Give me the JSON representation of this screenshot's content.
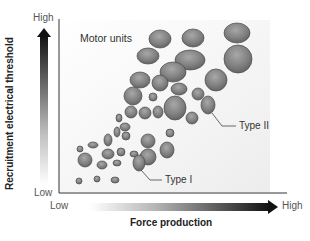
{
  "figure": {
    "title": "Motor units",
    "y_axis": {
      "title": "Recruitment electrical threshold",
      "high_label": "High",
      "low_label": "Low"
    },
    "x_axis": {
      "title": "Force production",
      "high_label": "High",
      "low_label": "Low"
    },
    "annotations": [
      {
        "label": "Type II",
        "target": "large fast-twitch motor unit"
      },
      {
        "label": "Type I",
        "target": "small slow-twitch motor unit"
      }
    ],
    "colors": {
      "unit_fill_dark": "#6b6b6b",
      "unit_fill_light": "#b0b0b0",
      "unit_stroke": "#4a4a4a",
      "axis": "#333333",
      "arrow_dark": "#1a1a1a",
      "panel_shade": "#f4f4f4"
    }
  },
  "units": [
    {
      "cx": 237,
      "cy": 33,
      "rx": 13,
      "ry": 10
    },
    {
      "cx": 238,
      "cy": 59,
      "rx": 14,
      "ry": 14
    },
    {
      "cx": 193,
      "cy": 38,
      "rx": 11,
      "ry": 9
    },
    {
      "cx": 160,
      "cy": 39,
      "rx": 11,
      "ry": 9
    },
    {
      "cx": 190,
      "cy": 60,
      "rx": 15,
      "ry": 10
    },
    {
      "cx": 216,
      "cy": 80,
      "rx": 11,
      "ry": 11
    },
    {
      "cx": 148,
      "cy": 56,
      "rx": 11,
      "ry": 8
    },
    {
      "cx": 173,
      "cy": 72,
      "rx": 13,
      "ry": 10
    },
    {
      "cx": 140,
      "cy": 80,
      "rx": 10,
      "ry": 8
    },
    {
      "cx": 160,
      "cy": 83,
      "rx": 8,
      "ry": 8
    },
    {
      "cx": 133,
      "cy": 96,
      "rx": 9,
      "ry": 9
    },
    {
      "cx": 179,
      "cy": 89,
      "rx": 8,
      "ry": 6
    },
    {
      "cx": 208,
      "cy": 105,
      "rx": 7,
      "ry": 9
    },
    {
      "cx": 198,
      "cy": 94,
      "rx": 6,
      "ry": 6
    },
    {
      "cx": 153,
      "cy": 97,
      "rx": 4,
      "ry": 4
    },
    {
      "cx": 175,
      "cy": 108,
      "rx": 11,
      "ry": 12
    },
    {
      "cx": 192,
      "cy": 118,
      "rx": 6,
      "ry": 6
    },
    {
      "cx": 131,
      "cy": 112,
      "rx": 6,
      "ry": 6
    },
    {
      "cx": 145,
      "cy": 113,
      "rx": 6,
      "ry": 6
    },
    {
      "cx": 158,
      "cy": 112,
      "rx": 5,
      "ry": 6
    },
    {
      "cx": 170,
      "cy": 133,
      "rx": 4,
      "ry": 4
    },
    {
      "cx": 119,
      "cy": 118,
      "rx": 3,
      "ry": 4
    },
    {
      "cx": 125,
      "cy": 127,
      "rx": 5,
      "ry": 4
    },
    {
      "cx": 117,
      "cy": 132,
      "rx": 3,
      "ry": 5
    },
    {
      "cx": 108,
      "cy": 140,
      "rx": 4,
      "ry": 6
    },
    {
      "cx": 126,
      "cy": 136,
      "rx": 4,
      "ry": 4
    },
    {
      "cx": 93,
      "cy": 145,
      "rx": 5,
      "ry": 3
    },
    {
      "cx": 108,
      "cy": 154,
      "rx": 6,
      "ry": 5
    },
    {
      "cx": 121,
      "cy": 152,
      "rx": 4,
      "ry": 4
    },
    {
      "cx": 134,
      "cy": 154,
      "rx": 4,
      "ry": 3
    },
    {
      "cx": 148,
      "cy": 141,
      "rx": 7,
      "ry": 7
    },
    {
      "cx": 148,
      "cy": 157,
      "rx": 8,
      "ry": 8
    },
    {
      "cx": 167,
      "cy": 150,
      "rx": 7,
      "ry": 8
    },
    {
      "cx": 80,
      "cy": 149,
      "rx": 3,
      "ry": 3
    },
    {
      "cx": 85,
      "cy": 160,
      "rx": 7,
      "ry": 7
    },
    {
      "cx": 102,
      "cy": 165,
      "rx": 5,
      "ry": 4
    },
    {
      "cx": 117,
      "cy": 163,
      "rx": 4,
      "ry": 3
    },
    {
      "cx": 139,
      "cy": 163,
      "rx": 6,
      "ry": 8
    },
    {
      "cx": 79,
      "cy": 181,
      "rx": 3,
      "ry": 3
    },
    {
      "cx": 97,
      "cy": 179,
      "rx": 3,
      "ry": 3
    },
    {
      "cx": 115,
      "cy": 180,
      "rx": 4,
      "ry": 3
    }
  ]
}
